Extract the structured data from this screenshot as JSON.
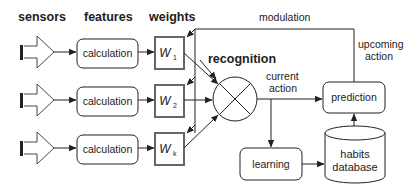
{
  "headers": {
    "sensors": "sensors",
    "features": "features",
    "weights": "weights",
    "recognition": "recognition"
  },
  "rows": [
    {
      "sensor_icon": "sensor-arrow-icon",
      "feature": "calculation",
      "weight_symbol": "W",
      "weight_subscript": "1"
    },
    {
      "sensor_icon": "sensor-arrow-icon",
      "feature": "calculation",
      "weight_symbol": "W",
      "weight_subscript": "2"
    },
    {
      "sensor_icon": "sensor-arrow-icon",
      "feature": "calculation",
      "weight_symbol": "W",
      "weight_subscript": "k"
    }
  ],
  "recognition_node": {
    "icon": "multiplier-circle-icon"
  },
  "annotations": {
    "modulation": "modulation",
    "upcoming_action_line1": "upcoming",
    "upcoming_action_line2": "action",
    "current_action_line1": "current",
    "current_action_line2": "action"
  },
  "boxes": {
    "prediction": "prediction",
    "learning": "learning",
    "habits_line1": "habits",
    "habits_line2": "database"
  },
  "colors": {
    "stroke": "#222222",
    "weight_border": "#555555",
    "background": "#ffffff"
  }
}
